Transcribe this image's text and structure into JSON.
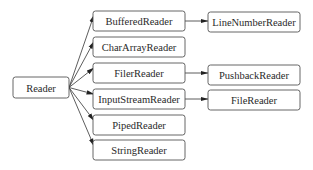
{
  "diagram": {
    "type": "class-hierarchy",
    "root": {
      "id": "reader",
      "label": "Reader"
    },
    "level1": [
      {
        "id": "bufferedreader",
        "label": "BufferedReader"
      },
      {
        "id": "chararrayreader",
        "label": "CharArrayReader"
      },
      {
        "id": "filerreader",
        "label": "FilerReader"
      },
      {
        "id": "inputstreamreader",
        "label": "InputStreamReader"
      },
      {
        "id": "pipedreader",
        "label": "PipedReader"
      },
      {
        "id": "stringreader",
        "label": "StringReader"
      }
    ],
    "level2": [
      {
        "id": "linenumberreader",
        "label": "LineNumberReader",
        "parent": "bufferedreader"
      },
      {
        "id": "pushbackreader",
        "label": "PushbackReader",
        "parent": "filerreader"
      },
      {
        "id": "filereader",
        "label": "FileReader",
        "parent": "inputstreamreader"
      }
    ],
    "edges": [
      {
        "from": "reader",
        "to": "bufferedreader"
      },
      {
        "from": "reader",
        "to": "chararrayreader"
      },
      {
        "from": "reader",
        "to": "filerreader"
      },
      {
        "from": "reader",
        "to": "inputstreamreader"
      },
      {
        "from": "reader",
        "to": "pipedreader"
      },
      {
        "from": "reader",
        "to": "stringreader"
      },
      {
        "from": "bufferedreader",
        "to": "linenumberreader"
      },
      {
        "from": "filerreader",
        "to": "pushbackreader"
      },
      {
        "from": "inputstreamreader",
        "to": "filereader"
      }
    ]
  }
}
